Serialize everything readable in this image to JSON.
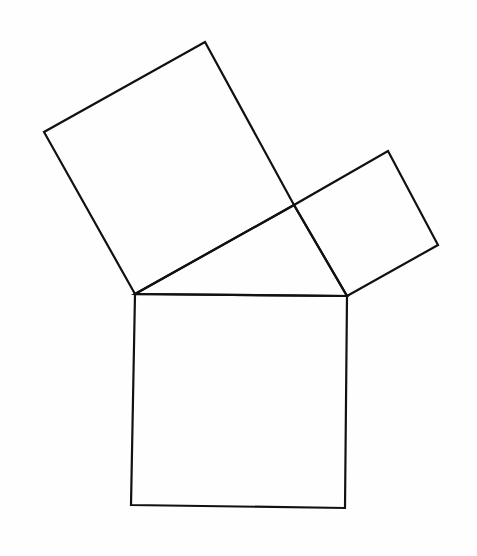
{
  "diagram": {
    "type": "pythagorean-squares",
    "background": "#fefefe",
    "stroke_color": "#111111",
    "stroke_width": 2.2,
    "shapes": [
      {
        "name": "hypotenuse-square",
        "points": "135,294 347,296 345,508 131,505"
      },
      {
        "name": "left-leg-square",
        "points": "135,294 44,132 205,42 294,205"
      },
      {
        "name": "right-leg-square",
        "points": "347,296 438,245 388,151 294,205"
      },
      {
        "name": "right-triangle",
        "points": "135,294 294,205 347,296"
      }
    ]
  }
}
